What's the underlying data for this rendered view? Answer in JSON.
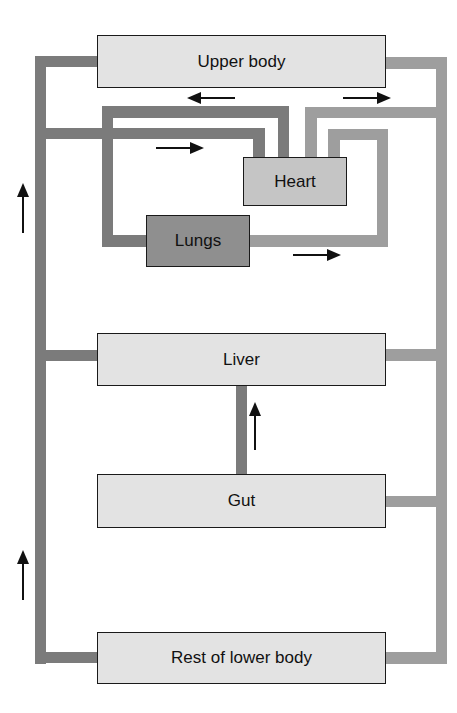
{
  "diagram": {
    "type": "circulatory-system-flow",
    "colors": {
      "pipe_dark": "#7b7b7b",
      "pipe_light": "#9e9e9e",
      "box_pale": "#e3e3e3",
      "box_heart": "#c5c5c5",
      "box_lungs": "#8f8f8f",
      "border": "#1a1a1a",
      "arrow": "#111111"
    },
    "nodes": {
      "upper_body": "Upper body",
      "heart": "Heart",
      "lungs": "Lungs",
      "liver": "Liver",
      "gut": "Gut",
      "lower_body": "Rest of lower body"
    },
    "arrows": [
      {
        "id": "return-left-upper",
        "direction": "up"
      },
      {
        "id": "return-left-lower",
        "direction": "up"
      },
      {
        "id": "upper-body-out",
        "direction": "left"
      },
      {
        "id": "to-upper-body",
        "direction": "right"
      },
      {
        "id": "into-heart",
        "direction": "right"
      },
      {
        "id": "lungs-out",
        "direction": "right"
      },
      {
        "id": "gut-to-liver",
        "direction": "up"
      }
    ]
  }
}
